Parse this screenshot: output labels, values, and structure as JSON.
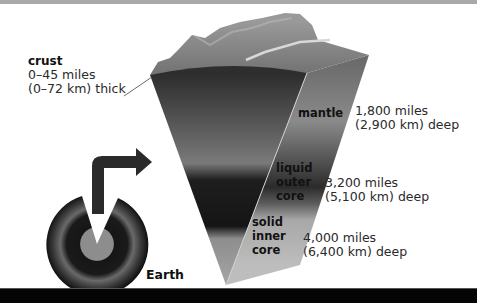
{
  "diagram": {
    "layers": [
      {
        "name": "crust",
        "line1": "0–45 miles",
        "line2": "(0–72 km) thick"
      },
      {
        "name": "mantle",
        "line1": "1,800 miles",
        "line2": "(2,900 km) deep"
      },
      {
        "name_lines": [
          "liquid",
          "outer",
          "core"
        ],
        "line1": "3,200 miles",
        "line2": "(5,100 km) deep"
      },
      {
        "name_lines": [
          "solid",
          "inner",
          "core"
        ],
        "line1": "4,000 miles",
        "line2": "(6,400 km) deep"
      }
    ],
    "earth_label": "Earth"
  },
  "colors": {
    "top_bar": "#a9a9a9",
    "bottom_bar": "#050505",
    "outer_core": "#1a1a1a",
    "inner_core": "#8a8a8a",
    "mantle": "#5a5a5a"
  }
}
